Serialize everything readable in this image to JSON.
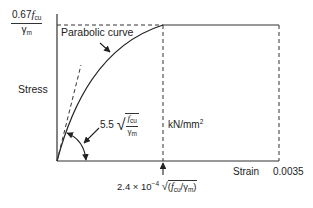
{
  "diagram": {
    "y_axis": {
      "label": "Stress",
      "max_label": {
        "numerator_coeff": "0.67",
        "numerator_var": "f",
        "numerator_sub": "cu",
        "denominator": "γ",
        "denominator_sub": "m"
      },
      "units": "kN/mm",
      "units_sup": "2"
    },
    "x_axis": {
      "label": "Strain",
      "max_value": "0.0035",
      "peak_strain_label": {
        "coeff": "2.4 × 10",
        "exp": "−4",
        "expr_open": "(",
        "var": "f",
        "var_sub": "cu",
        "slash": "/",
        "den": "γ",
        "den_sub": "m",
        "expr_close": ")"
      }
    },
    "annotations": {
      "curve_label": "Parabolic curve",
      "tangent_modulus": {
        "coeff": "5.5",
        "num_var": "f",
        "num_sub": "cu",
        "den": "γ",
        "den_sub": "m"
      }
    },
    "colors": {
      "line": "#222222",
      "background": "#ffffff"
    }
  }
}
